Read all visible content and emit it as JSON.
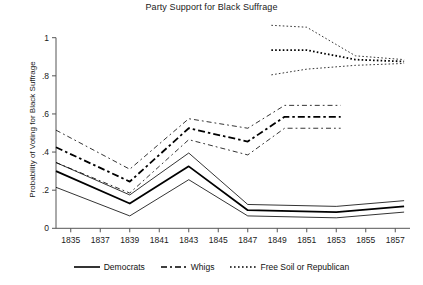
{
  "chart_data": {
    "type": "line",
    "title": "Party Support for Black Suffrage",
    "xlabel": "",
    "ylabel": "Probability of Voting for Black Suffrage",
    "xlim": [
      1834,
      1858
    ],
    "ylim": [
      0,
      1.1
    ],
    "xticks": [
      1835,
      1837,
      1839,
      1841,
      1843,
      1845,
      1847,
      1849,
      1851,
      1853,
      1855,
      1857
    ],
    "xtick_labels": [
      "1835",
      "1837",
      "1839",
      "1841",
      "1843",
      "1845",
      "1847",
      "1849",
      "1851",
      "1853",
      "1855",
      "1857"
    ],
    "yticks": [
      0,
      0.2,
      0.4,
      0.6,
      0.8,
      1
    ],
    "ytick_labels": [
      "0",
      ".2",
      ".4",
      ".6",
      ".8",
      "1"
    ],
    "grid": false,
    "legend_position": "bottom",
    "series": [
      {
        "name": "Democrats",
        "style": "solid",
        "color": "#000000",
        "x": [
          1834,
          1839,
          1843,
          1847,
          1853,
          1857.6
        ],
        "values": [
          0.3,
          0.13,
          0.325,
          0.095,
          0.085,
          0.115
        ],
        "ci_upper": [
          0.345,
          0.175,
          0.395,
          0.125,
          0.115,
          0.145
        ],
        "ci_lower": [
          0.215,
          0.065,
          0.255,
          0.065,
          0.055,
          0.085
        ]
      },
      {
        "name": "Whigs",
        "style": "dashed",
        "color": "#000000",
        "x": [
          1834,
          1839,
          1843,
          1847,
          1849.5,
          1853.3
        ],
        "values": [
          0.425,
          0.245,
          0.525,
          0.455,
          0.585,
          0.585
        ],
        "ci_upper": [
          0.515,
          0.31,
          0.575,
          0.525,
          0.645,
          0.645
        ],
        "ci_lower": [
          0.345,
          0.185,
          0.465,
          0.385,
          0.525,
          0.525
        ]
      },
      {
        "name": "Free Soil or Republican",
        "style": "dotted",
        "color": "#000000",
        "x": [
          1848.6,
          1851,
          1854.3,
          1857.6
        ],
        "values": [
          0.935,
          0.935,
          0.885,
          0.875
        ],
        "ci_upper": [
          1.065,
          1.055,
          0.905,
          0.885
        ],
        "ci_lower": [
          0.805,
          0.835,
          0.855,
          0.865
        ]
      }
    ]
  },
  "legend": {
    "items": [
      {
        "label": "Democrats",
        "style": "solid"
      },
      {
        "label": "Whigs",
        "style": "dashed"
      },
      {
        "label": "Free Soil or Republican",
        "style": "dotted"
      }
    ]
  }
}
